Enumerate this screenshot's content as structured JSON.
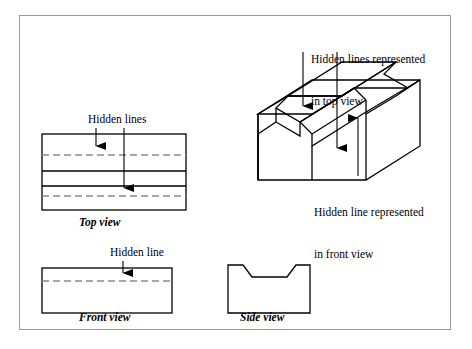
{
  "figure": {
    "type": "engineering-orthographic-projection"
  },
  "annotations": {
    "hidden_lines_top": "Hidden lines",
    "hidden_line_front": "Hidden line",
    "top_right_line1": "Hidden lines represented",
    "top_right_line2": "in top view",
    "bottom_right_line1": "Hidden line represented",
    "bottom_right_line2": "in front view"
  },
  "view_labels": {
    "top": "Top view",
    "front": "Front view",
    "side": "Side view"
  },
  "colors": {
    "line": "#000000",
    "hidden_line": "#7d7d7d",
    "frame": "#9a9a9a",
    "background": "#ffffff"
  },
  "geometry": {
    "top_view": {
      "x": 42,
      "y": 134,
      "width": 144,
      "height": 76,
      "solid_horizontal_lines": [
        134,
        171,
        186,
        210
      ],
      "hidden_horizontal_lines": [
        155,
        196
      ]
    },
    "front_view": {
      "x": 42,
      "y": 268,
      "width": 130,
      "height": 45,
      "hidden_horizontal_lines": [
        281
      ]
    },
    "side_view": {
      "x": 228,
      "y": 265,
      "width": 82,
      "height": 48,
      "notch": {
        "top_left_x": 243,
        "top_right_x": 296,
        "bottom_left_x": 252,
        "bottom_right_x": 287,
        "depth": 12
      }
    },
    "isometric": {
      "x": 258,
      "y": 62,
      "width": 178,
      "height": 98
    }
  }
}
